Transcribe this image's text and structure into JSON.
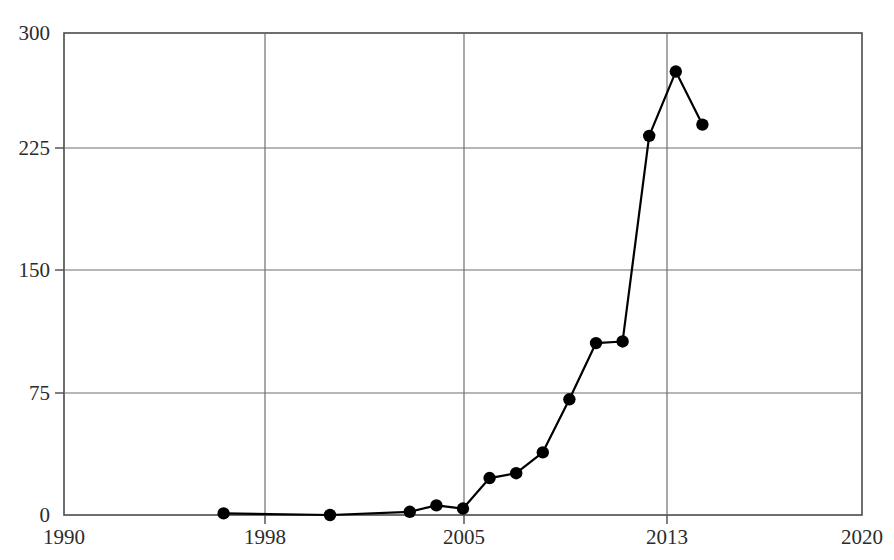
{
  "chart_data": {
    "type": "line",
    "title": "",
    "xlabel": "",
    "ylabel": "",
    "xlim": [
      1990,
      2020
    ],
    "ylim": [
      0,
      300
    ],
    "grid": true,
    "legend": null,
    "x_ticks": [
      "1990",
      "1998",
      "2005",
      "2013",
      "2020"
    ],
    "x_tick_values": [
      1990,
      1998,
      2005,
      2013,
      2020
    ],
    "y_ticks": [
      "0",
      "75",
      "150",
      "225",
      "300"
    ],
    "y_tick_values": [
      0,
      75,
      150,
      225,
      300
    ],
    "marker": "filled-circle",
    "marker_color": "#000000",
    "line_color": "#000000",
    "x": [
      1996,
      2000,
      2003,
      2004,
      2005,
      2006,
      2007,
      2008,
      2009,
      2010,
      2011,
      2012,
      2013,
      2014
    ],
    "values": [
      1,
      0,
      2,
      6,
      4,
      23,
      26,
      39,
      72,
      107,
      108,
      236,
      276,
      243
    ],
    "series": [
      {
        "name": "series-1",
        "points": [
          {
            "x": 1996,
            "y": 1
          },
          {
            "x": 2000,
            "y": 0
          },
          {
            "x": 2003,
            "y": 2
          },
          {
            "x": 2004,
            "y": 6
          },
          {
            "x": 2005,
            "y": 4
          },
          {
            "x": 2006,
            "y": 23
          },
          {
            "x": 2007,
            "y": 26
          },
          {
            "x": 2008,
            "y": 39
          },
          {
            "x": 2009,
            "y": 72
          },
          {
            "x": 2010,
            "y": 107
          },
          {
            "x": 2011,
            "y": 108
          },
          {
            "x": 2012,
            "y": 236
          },
          {
            "x": 2013,
            "y": 276
          },
          {
            "x": 2014,
            "y": 243
          }
        ]
      }
    ]
  },
  "axis": {
    "y_labels": [
      "300",
      "225",
      "150",
      "75",
      "0"
    ],
    "x_labels": [
      "1990",
      "1998",
      "2005",
      "2013",
      "2020"
    ]
  },
  "colors": {
    "line": "#000000",
    "marker": "#000000",
    "grid": "#6b6b6b",
    "frame": "#4a4a4a",
    "text": "#2b2b2b",
    "background": "#ffffff"
  }
}
